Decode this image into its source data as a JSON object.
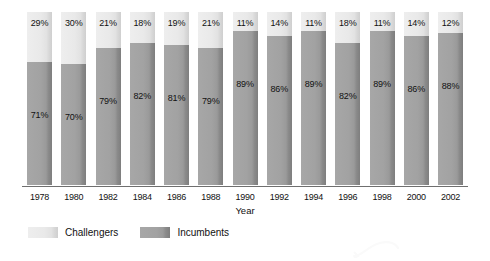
{
  "chart_data": {
    "type": "bar",
    "subtype": "stacked-100-percent",
    "title": "",
    "xlabel": "Year",
    "ylabel": "",
    "ylim": [
      0,
      100
    ],
    "grid": false,
    "legend_position": "bottom-left",
    "categories": [
      "1978",
      "1980",
      "1982",
      "1984",
      "1986",
      "1988",
      "1990",
      "1992",
      "1994",
      "1996",
      "1998",
      "2000",
      "2002"
    ],
    "series": [
      {
        "name": "Challengers",
        "color": "#e6e6e6",
        "values": [
          29,
          30,
          21,
          18,
          19,
          21,
          11,
          14,
          11,
          18,
          11,
          14,
          12
        ],
        "labels": [
          "29%",
          "30%",
          "21%",
          "18%",
          "19%",
          "21%",
          "11%",
          "14%",
          "11%",
          "18%",
          "11%",
          "14%",
          "12%"
        ]
      },
      {
        "name": "Incumbents",
        "color": "#9e9e9e",
        "values": [
          71,
          70,
          79,
          82,
          81,
          79,
          89,
          86,
          89,
          82,
          89,
          86,
          88
        ],
        "labels": [
          "71%",
          "70%",
          "79%",
          "82%",
          "81%",
          "79%",
          "89%",
          "86%",
          "89%",
          "82%",
          "89%",
          "86%",
          "88%"
        ]
      }
    ]
  },
  "axis": {
    "x_title": "Year"
  },
  "legend": {
    "items": [
      {
        "label": "Challengers",
        "swatch": "challengers"
      },
      {
        "label": "Incumbents",
        "swatch": "incumbents"
      }
    ]
  }
}
